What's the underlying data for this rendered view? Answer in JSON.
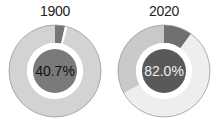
{
  "chart_data": [
    {
      "type": "pie",
      "subtype": "donut",
      "title": "1900",
      "center_label": "40.7%",
      "slices": [
        {
          "label": "dark",
          "value": 3.5,
          "color": "#757575"
        },
        {
          "label": "gap",
          "value": 1.0,
          "color": "#ffffff"
        },
        {
          "label": "light",
          "value": 95.5,
          "color": "#d3d3d3"
        }
      ],
      "center_color": "#7a7a7a"
    },
    {
      "type": "pie",
      "subtype": "donut",
      "title": "2020",
      "center_label": "82.0%",
      "slices": [
        {
          "label": "dark",
          "value": 10,
          "color": "#707070"
        },
        {
          "label": "very-light",
          "value": 57,
          "color": "#eeeeee"
        },
        {
          "label": "medium",
          "value": 33,
          "color": "#c9c9c9"
        }
      ],
      "center_color": "#595959"
    }
  ]
}
